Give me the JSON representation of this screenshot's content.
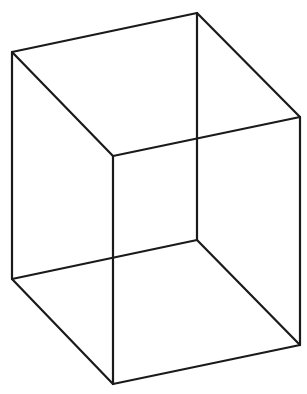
{
  "figure": {
    "title": "Wireframe cube (Necker cube)",
    "stroke_color": "#1a1a1a",
    "background": "#ffffff",
    "vertices": {
      "top_left": [
        12,
        52
      ],
      "top_back": [
        197,
        13
      ],
      "top_right": [
        300,
        117
      ],
      "top_front": [
        113,
        156
      ],
      "bottom_left": [
        12,
        279
      ],
      "bottom_back": [
        197,
        240
      ],
      "bottom_right": [
        300,
        345
      ],
      "bottom_front": [
        113,
        384
      ]
    },
    "edges": [
      [
        "top_left",
        "top_back"
      ],
      [
        "top_back",
        "top_right"
      ],
      [
        "top_right",
        "top_front"
      ],
      [
        "top_front",
        "top_left"
      ],
      [
        "bottom_left",
        "bottom_back"
      ],
      [
        "bottom_back",
        "bottom_right"
      ],
      [
        "bottom_right",
        "bottom_front"
      ],
      [
        "bottom_front",
        "bottom_left"
      ],
      [
        "top_left",
        "bottom_left"
      ],
      [
        "top_back",
        "bottom_back"
      ],
      [
        "top_right",
        "bottom_right"
      ],
      [
        "top_front",
        "bottom_front"
      ]
    ]
  }
}
